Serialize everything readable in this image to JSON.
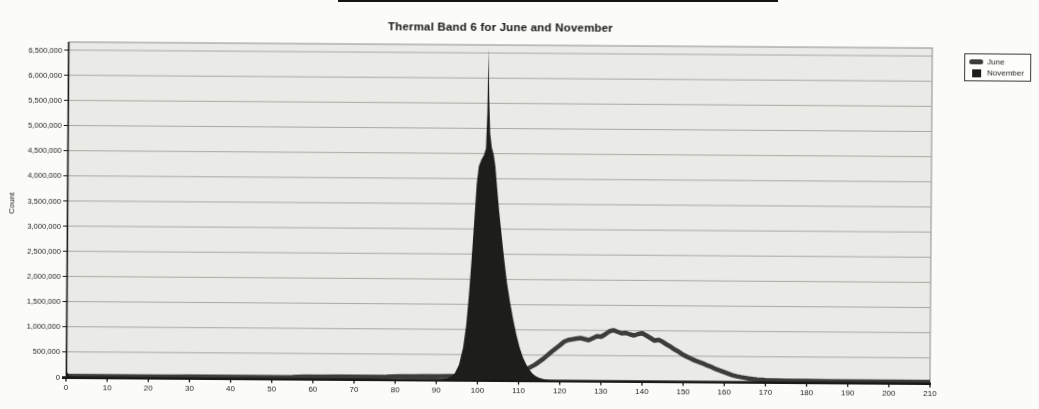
{
  "style": {
    "paper": "#fbfbf9",
    "plot_bg": "#eaeae6",
    "plot_border": "#8d8d88",
    "gridline": "#a9a9a4",
    "axis": "#1a1a18",
    "text": "#1e1e1b"
  },
  "chart_data": {
    "type": "area",
    "title": "Thermal Band 6 for June and November",
    "xlabel": "",
    "ylabel": "Count",
    "xlim": [
      0,
      210
    ],
    "ylim": [
      0,
      6660000
    ],
    "grid": "horizontal",
    "legend_position": "top-right-outside",
    "x_ticks": [
      0,
      10,
      20,
      30,
      40,
      50,
      60,
      70,
      80,
      90,
      100,
      110,
      120,
      130,
      140,
      150,
      160,
      170,
      180,
      190,
      200,
      210
    ],
    "y_ticks": [
      0,
      500000,
      1000000,
      1500000,
      2000000,
      2500000,
      3000000,
      3500000,
      4000000,
      4500000,
      5000000,
      5500000,
      6000000,
      6500000
    ],
    "series": [
      {
        "name": "June",
        "style": "line",
        "color": "#3c3c39",
        "points": [
          [
            0,
            22000
          ],
          [
            5,
            22000
          ],
          [
            10,
            22000
          ],
          [
            15,
            22000
          ],
          [
            20,
            22000
          ],
          [
            25,
            22000
          ],
          [
            30,
            23000
          ],
          [
            35,
            23000
          ],
          [
            40,
            23000
          ],
          [
            45,
            24000
          ],
          [
            50,
            25000
          ],
          [
            55,
            28000
          ],
          [
            58,
            38000
          ],
          [
            62,
            42000
          ],
          [
            66,
            43000
          ],
          [
            70,
            45000
          ],
          [
            74,
            46000
          ],
          [
            78,
            48000
          ],
          [
            81,
            58000
          ],
          [
            84,
            62000
          ],
          [
            87,
            64000
          ],
          [
            90,
            66000
          ],
          [
            93,
            68000
          ],
          [
            96,
            70000
          ],
          [
            99,
            74000
          ],
          [
            102,
            78000
          ],
          [
            104,
            82000
          ],
          [
            106,
            92000
          ],
          [
            108,
            115000
          ],
          [
            110,
            155000
          ],
          [
            112,
            220000
          ],
          [
            114,
            310000
          ],
          [
            116,
            430000
          ],
          [
            118,
            570000
          ],
          [
            120,
            700000
          ],
          [
            121,
            770000
          ],
          [
            122,
            805000
          ],
          [
            123,
            820000
          ],
          [
            124,
            835000
          ],
          [
            125,
            845000
          ],
          [
            126,
            825000
          ],
          [
            127,
            805000
          ],
          [
            128,
            845000
          ],
          [
            129,
            885000
          ],
          [
            130,
            875000
          ],
          [
            131,
            925000
          ],
          [
            132,
            985000
          ],
          [
            133,
            1005000
          ],
          [
            134,
            975000
          ],
          [
            135,
            945000
          ],
          [
            136,
            955000
          ],
          [
            137,
            925000
          ],
          [
            138,
            905000
          ],
          [
            139,
            935000
          ],
          [
            140,
            950000
          ],
          [
            141,
            905000
          ],
          [
            142,
            855000
          ],
          [
            143,
            805000
          ],
          [
            144,
            820000
          ],
          [
            145,
            780000
          ],
          [
            146,
            725000
          ],
          [
            147,
            680000
          ],
          [
            148,
            625000
          ],
          [
            149,
            580000
          ],
          [
            150,
            525000
          ],
          [
            151,
            485000
          ],
          [
            152,
            445000
          ],
          [
            153,
            410000
          ],
          [
            154,
            380000
          ],
          [
            155,
            350000
          ],
          [
            156,
            315000
          ],
          [
            157,
            285000
          ],
          [
            158,
            245000
          ],
          [
            159,
            215000
          ],
          [
            160,
            185000
          ],
          [
            161,
            155000
          ],
          [
            162,
            128000
          ],
          [
            163,
            108000
          ],
          [
            164,
            92000
          ],
          [
            165,
            78000
          ],
          [
            166,
            64000
          ],
          [
            167,
            54000
          ],
          [
            168,
            46000
          ],
          [
            170,
            36000
          ],
          [
            172,
            30000
          ],
          [
            175,
            26000
          ],
          [
            180,
            23000
          ],
          [
            185,
            22000
          ],
          [
            190,
            21000
          ],
          [
            195,
            21000
          ],
          [
            200,
            20000
          ],
          [
            205,
            20000
          ],
          [
            210,
            20000
          ]
        ]
      },
      {
        "name": "November",
        "style": "filled-area",
        "color": "#1d1d1a",
        "points": [
          [
            0,
            140000
          ],
          [
            0.7,
            30000
          ],
          [
            1.5,
            8000
          ],
          [
            20,
            6000
          ],
          [
            40,
            6000
          ],
          [
            60,
            6000
          ],
          [
            80,
            6000
          ],
          [
            88,
            7000
          ],
          [
            91,
            12000
          ],
          [
            92.5,
            25000
          ],
          [
            93.5,
            60000
          ],
          [
            94.5,
            130000
          ],
          [
            95.5,
            300000
          ],
          [
            96.5,
            650000
          ],
          [
            97.2,
            1100000
          ],
          [
            97.8,
            1700000
          ],
          [
            98.4,
            2400000
          ],
          [
            99,
            3200000
          ],
          [
            99.5,
            3900000
          ],
          [
            100,
            4250000
          ],
          [
            100.6,
            4380000
          ],
          [
            101.2,
            4470000
          ],
          [
            101.7,
            4600000
          ],
          [
            101.95,
            5300000
          ],
          [
            102.15,
            6600000
          ],
          [
            102.4,
            5600000
          ],
          [
            102.7,
            4900000
          ],
          [
            103.1,
            4620000
          ],
          [
            103.6,
            4480000
          ],
          [
            104,
            4250000
          ],
          [
            104.5,
            3800000
          ],
          [
            105,
            3350000
          ],
          [
            105.6,
            2900000
          ],
          [
            106.2,
            2480000
          ],
          [
            107,
            1950000
          ],
          [
            107.8,
            1550000
          ],
          [
            108.6,
            1200000
          ],
          [
            109.4,
            900000
          ],
          [
            110.2,
            650000
          ],
          [
            111,
            460000
          ],
          [
            111.8,
            320000
          ],
          [
            112.6,
            210000
          ],
          [
            113.4,
            130000
          ],
          [
            114.2,
            80000
          ],
          [
            115,
            48000
          ],
          [
            116,
            26000
          ],
          [
            117.5,
            12000
          ],
          [
            119,
            6000
          ],
          [
            122,
            4000
          ],
          [
            130,
            3000
          ],
          [
            150,
            3000
          ],
          [
            170,
            3000
          ],
          [
            190,
            3000
          ],
          [
            210,
            3000
          ]
        ]
      }
    ]
  }
}
